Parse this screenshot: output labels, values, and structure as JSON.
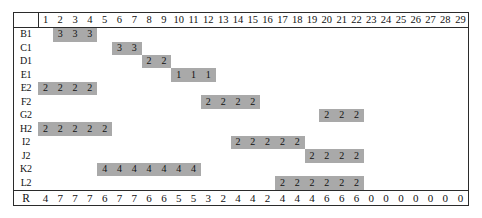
{
  "chart_data": {
    "type": "table",
    "xlabel": "",
    "ylabel": "",
    "grid": false,
    "legend": "none",
    "columns": [
      1,
      2,
      3,
      4,
      5,
      6,
      7,
      8,
      9,
      10,
      11,
      12,
      13,
      14,
      15,
      16,
      17,
      18,
      19,
      20,
      21,
      22,
      23,
      24,
      25,
      26,
      27,
      28,
      29
    ],
    "row_label_header": "",
    "rows": [
      {
        "label": "B1",
        "start": 2,
        "end": 4,
        "value": 3,
        "cells": [
          "",
          "3",
          "3",
          "3",
          "",
          "",
          "",
          "",
          "",
          "",
          "",
          "",
          "",
          "",
          "",
          "",
          "",
          "",
          "",
          "",
          "",
          "",
          "",
          "",
          "",
          "",
          "",
          "",
          ""
        ]
      },
      {
        "label": "C1",
        "start": 6,
        "end": 7,
        "value": 3,
        "cells": [
          "",
          "",
          "",
          "",
          "",
          "3",
          "3",
          "",
          "",
          "",
          "",
          "",
          "",
          "",
          "",
          "",
          "",
          "",
          "",
          "",
          "",
          "",
          "",
          "",
          "",
          "",
          "",
          "",
          ""
        ]
      },
      {
        "label": "D1",
        "start": 8,
        "end": 9,
        "value": 2,
        "cells": [
          "",
          "",
          "",
          "",
          "",
          "",
          "",
          "2",
          "2",
          "",
          "",
          "",
          "",
          "",
          "",
          "",
          "",
          "",
          "",
          "",
          "",
          "",
          "",
          "",
          "",
          "",
          "",
          "",
          ""
        ]
      },
      {
        "label": "E1",
        "start": 10,
        "end": 12,
        "value": 1,
        "cells": [
          "",
          "",
          "",
          "",
          "",
          "",
          "",
          "",
          "",
          "1",
          "1",
          "1",
          "",
          "",
          "",
          "",
          "",
          "",
          "",
          "",
          "",
          "",
          "",
          "",
          "",
          "",
          "",
          "",
          ""
        ]
      },
      {
        "label": "E2",
        "start": 1,
        "end": 4,
        "value": 2,
        "cells": [
          "2",
          "2",
          "2",
          "2",
          "",
          "",
          "",
          "",
          "",
          "",
          "",
          "",
          "",
          "",
          "",
          "",
          "",
          "",
          "",
          "",
          "",
          "",
          "",
          "",
          "",
          "",
          "",
          "",
          ""
        ]
      },
      {
        "label": "F2",
        "start": 12,
        "end": 15,
        "value": 2,
        "cells": [
          "",
          "",
          "",
          "",
          "",
          "",
          "",
          "",
          "",
          "",
          "",
          "2",
          "2",
          "2",
          "2",
          "",
          "",
          "",
          "",
          "",
          "",
          "",
          "",
          "",
          "",
          "",
          "",
          "",
          ""
        ]
      },
      {
        "label": "G2",
        "start": 20,
        "end": 22,
        "value": 2,
        "cells": [
          "",
          "",
          "",
          "",
          "",
          "",
          "",
          "",
          "",
          "",
          "",
          "",
          "",
          "",
          "",
          "",
          "",
          "",
          "",
          "2",
          "2",
          "2",
          "",
          "",
          "",
          "",
          "",
          "",
          ""
        ]
      },
      {
        "label": "H2",
        "start": 1,
        "end": 5,
        "value": 2,
        "cells": [
          "2",
          "2",
          "2",
          "2",
          "2",
          "",
          "",
          "",
          "",
          "",
          "",
          "",
          "",
          "",
          "",
          "",
          "",
          "",
          "",
          "",
          "",
          "",
          "",
          "",
          "",
          "",
          "",
          "",
          ""
        ]
      },
      {
        "label": "I2",
        "start": 14,
        "end": 18,
        "value": 2,
        "cells": [
          "",
          "",
          "",
          "",
          "",
          "",
          "",
          "",
          "",
          "",
          "",
          "",
          "",
          "2",
          "2",
          "2",
          "2",
          "2",
          "",
          "",
          "",
          "",
          "",
          "",
          "",
          "",
          "",
          "",
          ""
        ]
      },
      {
        "label": "J2",
        "start": 19,
        "end": 22,
        "value": 2,
        "cells": [
          "",
          "",
          "",
          "",
          "",
          "",
          "",
          "",
          "",
          "",
          "",
          "",
          "",
          "",
          "",
          "",
          "",
          "",
          "2",
          "2",
          "2",
          "2",
          "",
          "",
          "",
          "",
          "",
          "",
          ""
        ]
      },
      {
        "label": "K2",
        "start": 5,
        "end": 11,
        "value": 4,
        "cells": [
          "",
          "",
          "",
          "",
          "4",
          "4",
          "4",
          "4",
          "4",
          "4",
          "4",
          "",
          "",
          "",
          "",
          "",
          "",
          "",
          "",
          "",
          "",
          "",
          "",
          "",
          "",
          "",
          "",
          "",
          ""
        ]
      },
      {
        "label": "L2",
        "start": 17,
        "end": 22,
        "value": 2,
        "cells": [
          "",
          "",
          "",
          "",
          "",
          "",
          "",
          "",
          "",
          "",
          "",
          "",
          "",
          "",
          "",
          "",
          "2",
          "2",
          "2",
          "2",
          "2",
          "2",
          "",
          "",
          "",
          "",
          "",
          "",
          ""
        ]
      }
    ],
    "resource_row": {
      "label": "R",
      "values": [
        4,
        7,
        7,
        7,
        6,
        7,
        7,
        6,
        6,
        5,
        5,
        3,
        2,
        4,
        4,
        2,
        4,
        4,
        4,
        6,
        6,
        6,
        0,
        0,
        0,
        0,
        0,
        0,
        0
      ]
    },
    "colors": {
      "bar_fill": "#a9a9a9",
      "border": "#2b2b2b",
      "text": "#111111",
      "background": "#ffffff"
    }
  }
}
